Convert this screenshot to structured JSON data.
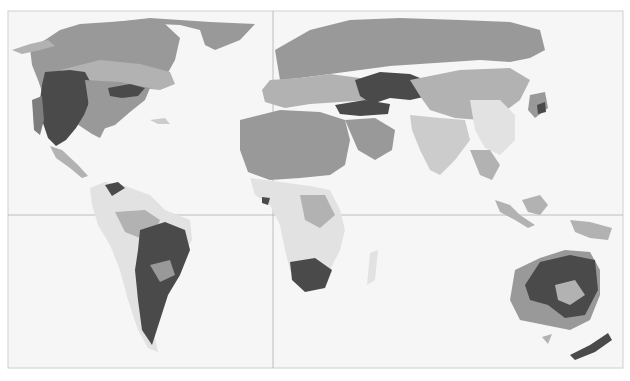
{
  "map": {
    "type": "world-choropleth-grayscale",
    "projection": "equirectangular-like",
    "background_color": "#f6f6f6",
    "frame_color": "#cfcfcf",
    "reference_lines": [
      {
        "name": "prime-meridian",
        "orientation": "vertical"
      },
      {
        "name": "equator",
        "orientation": "horizontal"
      }
    ],
    "shade_classes": [
      {
        "name": "darkest",
        "color": "#4a4a4a"
      },
      {
        "name": "dark",
        "color": "#7d7d7d"
      },
      {
        "name": "medium",
        "color": "#999999"
      },
      {
        "name": "light-medium",
        "color": "#b2b2b2"
      },
      {
        "name": "light",
        "color": "#cccccc"
      },
      {
        "name": "lightest",
        "color": "#e2e2e2"
      }
    ],
    "regions": [
      "North America",
      "Greenland",
      "Central America",
      "South America",
      "Europe",
      "Africa",
      "Middle East",
      "Russia",
      "Central Asia",
      "South Asia",
      "East Asia",
      "Southeast Asia",
      "Indonesia",
      "Madagascar",
      "Australia",
      "New Zealand",
      "Japan"
    ]
  }
}
